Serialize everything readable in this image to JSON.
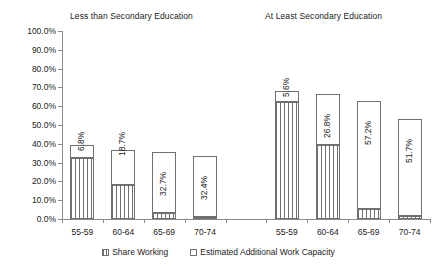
{
  "chart_data": {
    "type": "bar",
    "subtype": "stacked-bar-grouped",
    "title": "",
    "xlabel": "",
    "ylabel": "",
    "ylim": [
      0,
      100
    ],
    "yunit": "%",
    "grid": false,
    "legend_position": "bottom",
    "ytick_labels": [
      "100.0%",
      "90.0%",
      "80.0%",
      "70.0%",
      "60.0%",
      "50.0%",
      "40.0%",
      "30.0%",
      "20.0%",
      "10.0%",
      "0.0%"
    ],
    "ytick_values": [
      100,
      90,
      80,
      70,
      60,
      50,
      40,
      30,
      20,
      10,
      0
    ],
    "categories": [
      "55-59",
      "60-64",
      "65-69",
      "70-74",
      "",
      "55-59",
      "60-64",
      "65-69",
      "70-74"
    ],
    "groups": [
      {
        "name": "Less than Secondary Education",
        "categories": [
          "55-59",
          "60-64",
          "65-69",
          "70-74"
        ]
      },
      {
        "name": "At Least Secondary Education",
        "categories": [
          "55-59",
          "60-64",
          "65-69",
          "70-74"
        ]
      }
    ],
    "series": [
      {
        "name": "Share Working",
        "pattern": "vertical-hatch",
        "values": [
          32.3,
          18.0,
          3.2,
          0.9,
          null,
          62.4,
          39.6,
          5.5,
          1.5
        ]
      },
      {
        "name": "Estimated Additional Work Capacity",
        "pattern": "solid-white",
        "values": [
          6.8,
          18.7,
          32.7,
          32.4,
          null,
          5.6,
          26.8,
          57.2,
          51.7
        ]
      }
    ],
    "bar_totals": [
      39.1,
      36.7,
      35.9,
      33.3,
      null,
      68.0,
      66.4,
      62.7,
      53.2
    ],
    "data_labels": [
      "6.8%",
      "18.7%",
      "32.7%",
      "32.4%",
      null,
      "5.6%",
      "26.8%",
      "57.2%",
      "51.7%"
    ],
    "data_label_rotation": -90,
    "bars": [
      {
        "group": "Less than Secondary Education",
        "category": "55-59",
        "share_working": 32.3,
        "additional_capacity": 6.8,
        "total": 39.1,
        "label": "6.8%"
      },
      {
        "group": "Less than Secondary Education",
        "category": "60-64",
        "share_working": 18.0,
        "additional_capacity": 18.7,
        "total": 36.7,
        "label": "18.7%"
      },
      {
        "group": "Less than Secondary Education",
        "category": "65-69",
        "share_working": 3.2,
        "additional_capacity": 32.7,
        "total": 35.9,
        "label": "32.7%"
      },
      {
        "group": "Less than Secondary Education",
        "category": "70-74",
        "share_working": 0.9,
        "additional_capacity": 32.4,
        "total": 33.3,
        "label": "32.4%"
      },
      {
        "group": "At Least Secondary Education",
        "category": "55-59",
        "share_working": 62.4,
        "additional_capacity": 5.6,
        "total": 68.0,
        "label": "5.6%"
      },
      {
        "group": "At Least Secondary Education",
        "category": "60-64",
        "share_working": 39.6,
        "additional_capacity": 26.8,
        "total": 66.4,
        "label": "26.8%"
      },
      {
        "group": "At Least Secondary Education",
        "category": "65-69",
        "share_working": 5.5,
        "additional_capacity": 57.2,
        "total": 62.7,
        "label": "57.2%"
      },
      {
        "group": "At Least Secondary Education",
        "category": "70-74",
        "share_working": 1.5,
        "additional_capacity": 51.7,
        "total": 53.2,
        "label": "51.7%"
      }
    ],
    "legend": [
      {
        "label": "Share Working",
        "pattern": "vertical-hatch"
      },
      {
        "label": "Estimated Additional Work Capacity",
        "pattern": "solid-white"
      }
    ],
    "colors": {
      "line": "#6f6f6f",
      "axis": "#8a8a8a",
      "text": "#1a1a1a",
      "background": "#ffffff"
    }
  }
}
